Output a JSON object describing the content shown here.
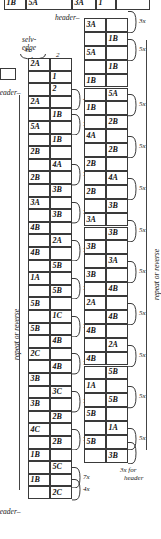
{
  "figure": {
    "labels": {
      "selvedge": "selv-\nedge",
      "selvedge_line1": "selv-",
      "selvedge_line2": "edge",
      "header_left": "header–",
      "header_right": "header–",
      "header_center": "header–",
      "repeat_left": "repeat or reverse",
      "repeat_right": "repeat or reverse",
      "footer_note_line1": "3x for",
      "footer_note_line2": "header"
    },
    "column_numbers": [
      "1",
      "2"
    ]
  },
  "top_strip": {
    "cells": [
      {
        "text": "1B"
      },
      {
        "text": "5A"
      },
      {
        "text": "3A"
      },
      {
        "text": "1"
      },
      {
        "text": ""
      }
    ],
    "second_row": [
      {
        "text": "1B"
      },
      {
        "text": "1B"
      },
      {
        "text": "2"
      }
    ]
  },
  "left_column": {
    "header_brace": "4x",
    "col_headers": [
      "1",
      "2"
    ],
    "rows": [
      {
        "left": "2A",
        "right": "",
        "note": ""
      },
      {
        "left": "",
        "right": "1",
        "note": ""
      },
      {
        "left": "",
        "right": "2",
        "note": ""
      },
      {
        "left": "2A",
        "right": "",
        "note": "4x"
      },
      {
        "left": "",
        "right": "1B",
        "note": ""
      },
      {
        "left": "5A",
        "right": "",
        "note": "7x"
      },
      {
        "left": "",
        "right": "1B",
        "note": ""
      },
      {
        "left": "2B",
        "right": "",
        "note": ""
      },
      {
        "left": "",
        "right": "4A",
        "note": ""
      },
      {
        "left": "2B",
        "right": "",
        "note": "7x"
      },
      {
        "left": "",
        "right": "3B",
        "note": ""
      },
      {
        "left": "3A",
        "right": "",
        "note": ""
      },
      {
        "left": "",
        "right": "3B",
        "note": "7x"
      },
      {
        "left": "4B",
        "right": "",
        "note": ""
      },
      {
        "left": "",
        "right": "2A",
        "note": ""
      },
      {
        "left": "4B",
        "right": "",
        "note": "7x"
      },
      {
        "left": "",
        "right": "5B",
        "note": ""
      },
      {
        "left": "1A",
        "right": "",
        "note": ""
      },
      {
        "left": "",
        "right": "5B",
        "note": "7x"
      },
      {
        "left": "5B",
        "right": "",
        "note": ""
      },
      {
        "left": "",
        "right": "1C",
        "note": ""
      },
      {
        "left": "5B",
        "right": "",
        "note": "7x"
      },
      {
        "left": "",
        "right": "4B",
        "note": ""
      },
      {
        "left": "2C",
        "right": "",
        "note": ""
      },
      {
        "left": "",
        "right": "4B",
        "note": "7x"
      },
      {
        "left": "3B",
        "right": "",
        "note": ""
      },
      {
        "left": "",
        "right": "3C",
        "note": ""
      },
      {
        "left": "3B",
        "right": "",
        "note": "7x"
      },
      {
        "left": "",
        "right": "2B",
        "note": ""
      },
      {
        "left": "4C",
        "right": "",
        "note": ""
      },
      {
        "left": "",
        "right": "2B",
        "note": "7x"
      },
      {
        "left": "1B",
        "right": "",
        "note": ""
      },
      {
        "left": "",
        "right": "5C",
        "note": ""
      },
      {
        "left": "1B",
        "right": "",
        "note": "7x"
      },
      {
        "left": "",
        "right": "2C",
        "note": "4x"
      }
    ]
  },
  "right_column": {
    "rows": [
      {
        "left": "3A",
        "right": "",
        "note": "3x"
      },
      {
        "left": "",
        "right": "1B",
        "note": ""
      },
      {
        "left": "5A",
        "right": "",
        "note": "5x"
      },
      {
        "left": "",
        "right": "1B",
        "note": ""
      },
      {
        "left": "1B",
        "right": "",
        "note": ""
      },
      {
        "left": "",
        "right": "5A",
        "note": ""
      },
      {
        "left": "1B",
        "right": "",
        "note": "5x"
      },
      {
        "left": "",
        "right": "2B",
        "note": ""
      },
      {
        "left": "4A",
        "right": "",
        "note": ""
      },
      {
        "left": "",
        "right": "2B",
        "note": "5x"
      },
      {
        "left": "2B",
        "right": "",
        "note": ""
      },
      {
        "left": "",
        "right": "4A",
        "note": ""
      },
      {
        "left": "2B",
        "right": "",
        "note": "5x"
      },
      {
        "left": "",
        "right": "3B",
        "note": ""
      },
      {
        "left": "3A",
        "right": "",
        "note": ""
      },
      {
        "left": "",
        "right": "3B",
        "note": "5x"
      },
      {
        "left": "3B",
        "right": "",
        "note": ""
      },
      {
        "left": "",
        "right": "3A",
        "note": ""
      },
      {
        "left": "3B",
        "right": "",
        "note": "5x"
      },
      {
        "left": "",
        "right": "4B",
        "note": ""
      },
      {
        "left": "2A",
        "right": "",
        "note": ""
      },
      {
        "left": "",
        "right": "4B",
        "note": "5x"
      },
      {
        "left": "4B",
        "right": "",
        "note": ""
      },
      {
        "left": "",
        "right": "2A",
        "note": ""
      },
      {
        "left": "4B",
        "right": "",
        "note": "5x"
      },
      {
        "left": "",
        "right": "5B",
        "note": ""
      },
      {
        "left": "1A",
        "right": "",
        "note": ""
      },
      {
        "left": "",
        "right": "5B",
        "note": "5x"
      },
      {
        "left": "5B",
        "right": "",
        "note": ""
      },
      {
        "left": "",
        "right": "1A",
        "note": ""
      },
      {
        "left": "5B",
        "right": "",
        "note": "5x"
      },
      {
        "left": "",
        "right": "3B",
        "note": "3x for header"
      }
    ]
  }
}
